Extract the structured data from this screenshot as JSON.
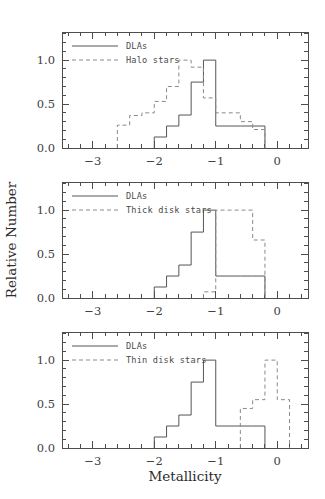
{
  "figure": {
    "xlabel": "Metallicity",
    "ylabel": "Relative Number"
  },
  "axes": {
    "xlim": [
      -3.5,
      0.5
    ],
    "ylim": [
      0.0,
      1.32
    ],
    "xticks": [
      -3,
      -2,
      -1,
      0
    ],
    "xticklabels": [
      "−3",
      "−2",
      "−1",
      "0"
    ],
    "yticks": [
      0.0,
      0.5,
      1.0
    ],
    "yticklabels": [
      "0.0",
      "0.5",
      "1.0"
    ],
    "xminor_step": 0.2,
    "yminor_step": 0.1,
    "grid": false
  },
  "colors": {
    "dla": "#555555",
    "stars": "#8a8a8a",
    "frame": "#4d4d4d",
    "text": "#2b2b2b",
    "background": "#ffffff"
  },
  "chart_data": [
    {
      "type": "line",
      "panel": 1,
      "title": "",
      "xlabel": "",
      "ylabel": "Relative Number",
      "xlim": [
        -3.5,
        0.5
      ],
      "ylim": [
        0.0,
        1.32
      ],
      "grid": false,
      "legend_position": "upper-left",
      "series": [
        {
          "name": "DLAs",
          "style": "solid",
          "bin_edges": [
            -2.0,
            -1.8,
            -1.6,
            -1.4,
            -1.2,
            -1.0,
            -0.8,
            -0.6,
            -0.4,
            -0.2
          ],
          "values": [
            0.125,
            0.25,
            0.375,
            0.75,
            1.0,
            0.25,
            0.25,
            0.25,
            0.25
          ]
        },
        {
          "name": "Halo stars",
          "style": "dashed",
          "bin_edges": [
            -2.6,
            -2.4,
            -2.2,
            -2.0,
            -1.8,
            -1.6,
            -1.4,
            -1.2,
            -1.0,
            -0.8,
            -0.6,
            -0.4,
            -0.2
          ],
          "values": [
            0.26,
            0.37,
            0.4,
            0.53,
            0.7,
            1.0,
            0.92,
            0.57,
            0.4,
            0.4,
            0.3,
            0.21
          ]
        }
      ]
    },
    {
      "type": "line",
      "panel": 2,
      "title": "",
      "xlabel": "",
      "ylabel": "Relative Number",
      "xlim": [
        -3.5,
        0.5
      ],
      "ylim": [
        0.0,
        1.32
      ],
      "grid": false,
      "legend_position": "upper-left",
      "series": [
        {
          "name": "DLAs",
          "style": "solid",
          "bin_edges": [
            -2.0,
            -1.8,
            -1.6,
            -1.4,
            -1.2,
            -1.0,
            -0.8,
            -0.6,
            -0.4,
            -0.2
          ],
          "values": [
            0.125,
            0.25,
            0.375,
            0.75,
            1.0,
            0.25,
            0.25,
            0.25,
            0.25
          ]
        },
        {
          "name": "Thick disk stars",
          "style": "dashed",
          "bin_edges": [
            -1.2,
            -1.0,
            -0.8,
            -0.6,
            -0.4,
            -0.2
          ],
          "values": [
            0.07,
            1.0,
            1.0,
            1.0,
            0.66
          ]
        }
      ]
    },
    {
      "type": "line",
      "panel": 3,
      "title": "",
      "xlabel": "Metallicity",
      "ylabel": "Relative Number",
      "xlim": [
        -3.5,
        0.5
      ],
      "ylim": [
        0.0,
        1.32
      ],
      "grid": false,
      "legend_position": "upper-left",
      "series": [
        {
          "name": "DLAs",
          "style": "solid",
          "bin_edges": [
            -2.0,
            -1.8,
            -1.6,
            -1.4,
            -1.2,
            -1.0,
            -0.8,
            -0.6,
            -0.4,
            -0.2
          ],
          "values": [
            0.125,
            0.25,
            0.375,
            0.75,
            1.0,
            0.25,
            0.25,
            0.25,
            0.25
          ]
        },
        {
          "name": "Thin disk stars",
          "style": "dashed",
          "bin_edges": [
            -0.6,
            -0.4,
            -0.2,
            0.0,
            0.2
          ],
          "values": [
            0.45,
            0.55,
            1.0,
            0.55
          ]
        }
      ]
    }
  ],
  "panels": [
    {
      "legend": [
        {
          "label": "DLAs",
          "style": "solid"
        },
        {
          "label": "Halo stars",
          "style": "dashed"
        }
      ]
    },
    {
      "legend": [
        {
          "label": "DLAs",
          "style": "solid"
        },
        {
          "label": "Thick disk stars",
          "style": "dashed"
        }
      ]
    },
    {
      "legend": [
        {
          "label": "DLAs",
          "style": "solid"
        },
        {
          "label": "Thin disk stars",
          "style": "dashed"
        }
      ]
    }
  ]
}
